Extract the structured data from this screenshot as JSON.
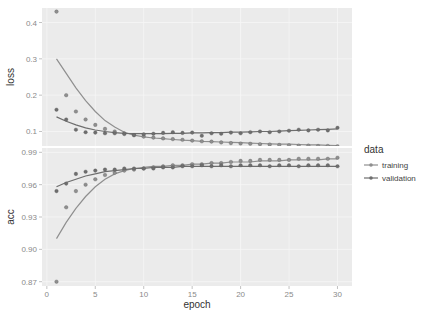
{
  "chart_data": {
    "type": "scatter",
    "title": "",
    "xlabel": "epoch",
    "x": [
      1,
      2,
      3,
      4,
      5,
      6,
      7,
      8,
      9,
      10,
      11,
      12,
      13,
      14,
      15,
      16,
      17,
      18,
      19,
      20,
      21,
      22,
      23,
      24,
      25,
      26,
      27,
      28,
      29,
      30
    ],
    "xlim": [
      0,
      30
    ],
    "xticks": [
      "0",
      "5",
      "10",
      "15",
      "20",
      "25",
      "30"
    ],
    "grid": true,
    "legend_position": "right",
    "legend_title": "data",
    "legend": [
      "training",
      "validation"
    ],
    "colors": {
      "training": "#8f8f8f",
      "validation": "#6e6e6e",
      "panel_bg": "#ebebeb"
    },
    "panels": [
      {
        "name": "loss",
        "ylabel": "loss",
        "ylim": [
          0.06,
          0.44
        ],
        "yticks": [
          "0.1",
          "0.2",
          "0.3",
          "0.4"
        ],
        "series": [
          {
            "name": "training",
            "values": [
              0.43,
              0.2,
              0.155,
              0.133,
              0.118,
              0.107,
              0.1,
              0.095,
              0.09,
              0.086,
              0.083,
              0.081,
              0.079,
              0.077,
              0.075,
              0.073,
              0.072,
              0.07,
              0.068,
              0.067,
              0.066,
              0.065,
              0.064,
              0.063,
              0.062,
              0.061,
              0.061,
              0.06,
              0.06,
              0.059
            ],
            "smooth": [
              0.3,
              0.26,
              0.22,
              0.185,
              0.155,
              0.13,
              0.112,
              0.098,
              0.09,
              0.085,
              0.082,
              0.08,
              0.078,
              0.076,
              0.075,
              0.073,
              0.072,
              0.071,
              0.07,
              0.069,
              0.068,
              0.067,
              0.066,
              0.065,
              0.065,
              0.064,
              0.063,
              0.063,
              0.062,
              0.061
            ]
          },
          {
            "name": "validation",
            "values": [
              0.16,
              0.133,
              0.105,
              0.098,
              0.097,
              0.095,
              0.095,
              0.093,
              0.09,
              0.092,
              0.094,
              0.096,
              0.098,
              0.096,
              0.097,
              0.088,
              0.095,
              0.094,
              0.097,
              0.095,
              0.098,
              0.1,
              0.098,
              0.1,
              0.102,
              0.105,
              0.103,
              0.105,
              0.103,
              0.11
            ],
            "smooth": [
              0.14,
              0.128,
              0.118,
              0.11,
              0.104,
              0.1,
              0.097,
              0.095,
              0.094,
              0.094,
              0.094,
              0.094,
              0.095,
              0.095,
              0.096,
              0.096,
              0.097,
              0.097,
              0.098,
              0.098,
              0.099,
              0.1,
              0.1,
              0.101,
              0.102,
              0.103,
              0.104,
              0.105,
              0.106,
              0.107
            ]
          }
        ]
      },
      {
        "name": "acc",
        "ylabel": "acc",
        "ylim": [
          0.866,
          0.994
        ],
        "yticks": [
          "0.87",
          "0.90",
          "0.93",
          "0.96",
          "0.99"
        ],
        "series": [
          {
            "name": "training",
            "values": [
              0.87,
              0.939,
              0.954,
              0.96,
              0.965,
              0.969,
              0.971,
              0.973,
              0.974,
              0.975,
              0.976,
              0.977,
              0.978,
              0.978,
              0.979,
              0.979,
              0.98,
              0.98,
              0.981,
              0.982,
              0.982,
              0.983,
              0.983,
              0.983,
              0.983,
              0.984,
              0.984,
              0.984,
              0.984,
              0.985
            ],
            "smooth": [
              0.91,
              0.925,
              0.938,
              0.949,
              0.958,
              0.965,
              0.97,
              0.973,
              0.975,
              0.976,
              0.977,
              0.977,
              0.978,
              0.978,
              0.979,
              0.979,
              0.98,
              0.98,
              0.981,
              0.981,
              0.981,
              0.982,
              0.982,
              0.982,
              0.983,
              0.983,
              0.983,
              0.983,
              0.984,
              0.984
            ]
          },
          {
            "name": "validation",
            "values": [
              0.954,
              0.961,
              0.97,
              0.972,
              0.973,
              0.974,
              0.974,
              0.975,
              0.975,
              0.975,
              0.975,
              0.976,
              0.976,
              0.977,
              0.977,
              0.978,
              0.977,
              0.978,
              0.977,
              0.978,
              0.978,
              0.978,
              0.977,
              0.978,
              0.978,
              0.977,
              0.978,
              0.978,
              0.978,
              0.977
            ],
            "smooth": [
              0.958,
              0.962,
              0.965,
              0.968,
              0.97,
              0.972,
              0.973,
              0.974,
              0.975,
              0.975,
              0.976,
              0.976,
              0.976,
              0.977,
              0.977,
              0.977,
              0.977,
              0.977,
              0.977,
              0.977,
              0.977,
              0.977,
              0.977,
              0.977,
              0.977,
              0.977,
              0.977,
              0.977,
              0.977,
              0.977
            ]
          }
        ]
      }
    ]
  }
}
